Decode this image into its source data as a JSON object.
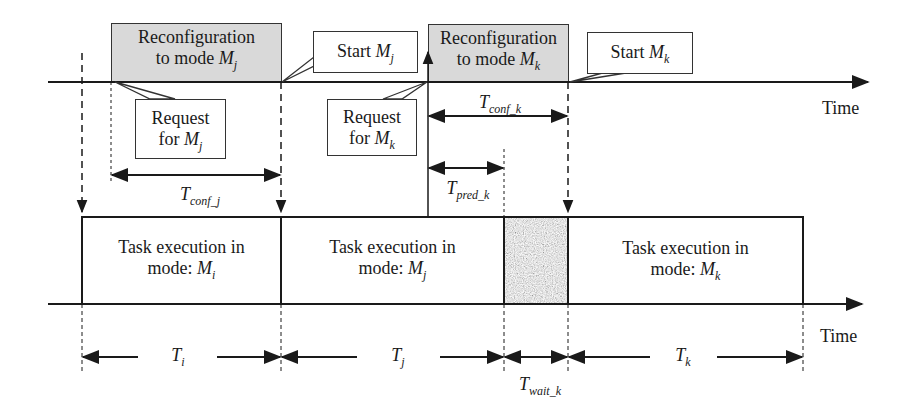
{
  "diagram": {
    "type": "timing-diagram",
    "top_timeline": {
      "axis_label": "Time",
      "reconfig_blocks": [
        {
          "line1": "Reconfiguration",
          "line2_prefix": "to mode ",
          "mode": "M",
          "mode_sub": "j"
        },
        {
          "line1": "Reconfiguration",
          "line2_prefix": "to mode ",
          "mode": "M",
          "mode_sub": "k"
        }
      ],
      "callouts": [
        {
          "line1": "Request",
          "line2_prefix": "for ",
          "mode": "M",
          "mode_sub": "j"
        },
        {
          "prefix": "Start ",
          "mode": "M",
          "mode_sub": "j"
        },
        {
          "line1": "Request",
          "line2_prefix": "for ",
          "mode": "M",
          "mode_sub": "k"
        },
        {
          "prefix": "Start ",
          "mode": "M",
          "mode_sub": "k"
        }
      ],
      "intervals": [
        {
          "symbol": "T",
          "sub": "conf_j"
        },
        {
          "symbol": "T",
          "sub": "conf_k"
        },
        {
          "symbol": "T",
          "sub": "pred_k"
        }
      ]
    },
    "bottom_timeline": {
      "axis_label": "Time",
      "tasks": [
        {
          "line1": "Task execution in",
          "line2_prefix": "mode: ",
          "mode": "M",
          "mode_sub": "i"
        },
        {
          "line1": "Task execution in",
          "line2_prefix": "mode: ",
          "mode": "M",
          "mode_sub": "j"
        },
        {
          "line1": "Task execution in",
          "line2_prefix": "mode: ",
          "mode": "M",
          "mode_sub": "k"
        }
      ],
      "wait_block": "noise-pattern",
      "durations": [
        {
          "symbol": "T",
          "sub": "i"
        },
        {
          "symbol": "T",
          "sub": "j"
        },
        {
          "symbol": "T",
          "sub": "wait_k"
        },
        {
          "symbol": "T",
          "sub": "k"
        }
      ]
    }
  }
}
